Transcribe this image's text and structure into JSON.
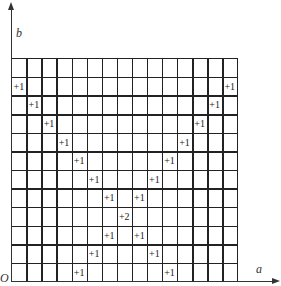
{
  "axes": {
    "y_label": "b",
    "x_label": "a",
    "origin_label": "O"
  },
  "grid": {
    "columns": 15,
    "rows": 12
  },
  "cells": [
    {
      "row": 1,
      "col": 0,
      "text": "+1"
    },
    {
      "row": 1,
      "col": 14,
      "text": "+1"
    },
    {
      "row": 2,
      "col": 1,
      "text": "+1"
    },
    {
      "row": 2,
      "col": 13,
      "text": "+1"
    },
    {
      "row": 3,
      "col": 2,
      "text": "+1"
    },
    {
      "row": 3,
      "col": 12,
      "text": "+1"
    },
    {
      "row": 4,
      "col": 3,
      "text": "+1"
    },
    {
      "row": 4,
      "col": 11,
      "text": "+1"
    },
    {
      "row": 5,
      "col": 4,
      "text": "+1"
    },
    {
      "row": 5,
      "col": 10,
      "text": "+1"
    },
    {
      "row": 6,
      "col": 5,
      "text": "+1"
    },
    {
      "row": 6,
      "col": 9,
      "text": "+1"
    },
    {
      "row": 7,
      "col": 6,
      "text": "+1"
    },
    {
      "row": 7,
      "col": 8,
      "text": "+1"
    },
    {
      "row": 8,
      "col": 7,
      "text": "+2"
    },
    {
      "row": 9,
      "col": 6,
      "text": "+1"
    },
    {
      "row": 9,
      "col": 8,
      "text": "+1"
    },
    {
      "row": 10,
      "col": 5,
      "text": "+1"
    },
    {
      "row": 10,
      "col": 9,
      "text": "+1"
    },
    {
      "row": 11,
      "col": 4,
      "text": "+1"
    },
    {
      "row": 11,
      "col": 10,
      "text": "+1"
    }
  ]
}
